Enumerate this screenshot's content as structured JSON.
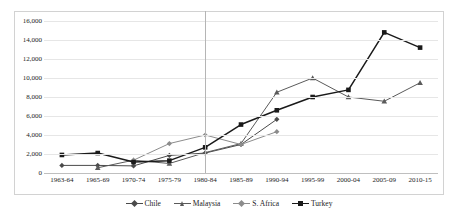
{
  "chart_data": {
    "type": "line",
    "title": "",
    "xlabel": "",
    "ylabel": "",
    "ylim": [
      0,
      16000
    ],
    "ytick_step": 2000,
    "grid": true,
    "legend_position": "bottom",
    "categories": [
      "1963-64",
      "1965-69",
      "1970-74",
      "1975-79",
      "1980-84",
      "1985-89",
      "1990-94",
      "1995-99",
      "2000-04",
      "2005-09",
      "2010-15"
    ],
    "ytick_labels": [
      "0",
      "2,000",
      "4,000",
      "6,000",
      "8,000",
      "10,000",
      "12,000",
      "14,000",
      "16,000"
    ],
    "annotations": [
      {
        "name": "reference-line",
        "type": "vertical-line",
        "at_category": "1980-84"
      }
    ],
    "series": [
      {
        "name": "Chile",
        "marker": "diamond",
        "color": "#4a4a4a",
        "values": [
          800,
          800,
          750,
          1850,
          2100,
          3000,
          5650,
          null,
          null,
          null,
          null
        ]
      },
      {
        "name": "Malaysia",
        "marker": "triangle",
        "color": "#5a5a5a",
        "values": [
          null,
          550,
          1350,
          1000,
          2150,
          3100,
          8500,
          10000,
          8000,
          7550,
          9500
        ]
      },
      {
        "name": "S. Africa",
        "marker": "diamond",
        "color": "#8c8c8c",
        "values": [
          null,
          null,
          1350,
          3100,
          4000,
          3000,
          4350,
          null,
          null,
          null,
          null
        ]
      },
      {
        "name": "Turkey",
        "marker": "square",
        "color": "#1a1a1a",
        "values": [
          1900,
          2100,
          1150,
          1300,
          2700,
          5100,
          6600,
          8000,
          8750,
          14800,
          13200
        ]
      }
    ]
  },
  "legend": {
    "items": [
      {
        "label": "Chile",
        "marker": "diamond",
        "color": "#4a4a4a"
      },
      {
        "label": "Malaysia",
        "marker": "triangle",
        "color": "#5a5a5a"
      },
      {
        "label": "S. Africa",
        "marker": "diamond",
        "color": "#8c8c8c"
      },
      {
        "label": "Turkey",
        "marker": "square",
        "color": "#1a1a1a"
      }
    ]
  }
}
